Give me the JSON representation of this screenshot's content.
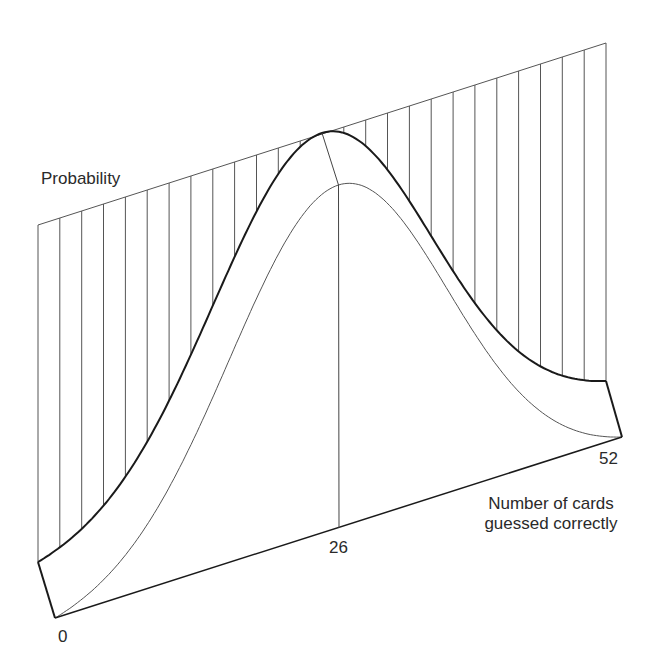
{
  "labels": {
    "y_axis": "Probability",
    "x_axis_line1": "Number of cards",
    "x_axis_line2": "guessed correctly",
    "tick_0": "0",
    "tick_26": "26",
    "tick_52": "52"
  },
  "colors": {
    "ink": "#1a1a1a",
    "thin": "#555555",
    "background": "#ffffff"
  },
  "chart_data": {
    "type": "line",
    "title": "",
    "xlabel": "Number of cards guessed correctly",
    "ylabel": "Probability",
    "xlim": [
      0,
      52
    ],
    "x_ticks": [
      0,
      26,
      52
    ],
    "series": [
      {
        "name": "Probability distribution",
        "peak_x": 26,
        "shape": "normal",
        "mean": 26,
        "sd": 10
      }
    ],
    "hatch_step": 2
  },
  "geometry": {
    "back_left_base": [
      38,
      562
    ],
    "back_right_base": [
      606,
      381
    ],
    "back_left_top": [
      38,
      225
    ],
    "back_right_top": [
      606,
      43
    ],
    "back_peak_y": 133,
    "front_left": [
      55,
      618
    ],
    "front_right": [
      622,
      437
    ],
    "front_peak_y": 185,
    "front_mid_base": [
      339,
      528
    ]
  }
}
